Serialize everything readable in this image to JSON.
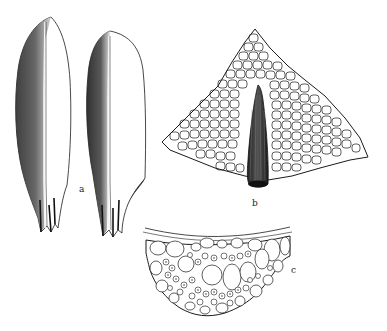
{
  "figure": {
    "background": "#ffffff",
    "ink": "#1a1a1a",
    "panels": [
      {
        "id": "a",
        "label": "a",
        "subject": "two leaves, dorsal view, with costa",
        "label_pos": [
          79,
          185
        ]
      },
      {
        "id": "b",
        "label": "b",
        "subject": "leaf apex cell network with excurrent costa",
        "label_pos": [
          252,
          199
        ]
      },
      {
        "id": "c",
        "label": "c",
        "subject": "cross-section of costa",
        "label_pos": [
          291,
          266
        ]
      }
    ]
  }
}
